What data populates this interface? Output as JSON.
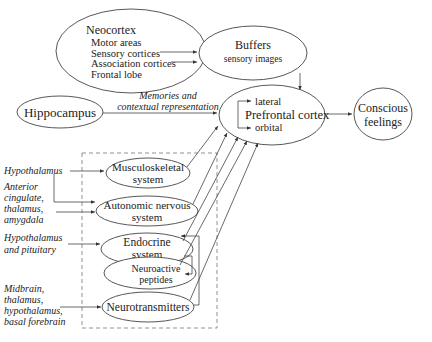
{
  "nodes": {
    "neocortex": {
      "title": "Neocortex",
      "items": [
        "Motor areas",
        "Sensory cortices",
        "Association cortices",
        "Frontal lobe"
      ]
    },
    "buffers": {
      "title": "Buffers",
      "subtitle": "sensory images"
    },
    "hippocampus": {
      "title": "Hippocampus"
    },
    "prefrontal": {
      "title": "Prefrontal cortex",
      "top": "lateral",
      "bottom": "orbital"
    },
    "conscious": {
      "line1": "Conscious",
      "line2": "feelings"
    },
    "musculoskeletal": {
      "line1": "Musculoskeletal",
      "line2": "system"
    },
    "autonomic": {
      "line1": "Autonomic nervous",
      "line2": "system"
    },
    "endocrine": {
      "line1": "Endocrine",
      "line2": "system"
    },
    "peptides": {
      "line1": "Neuroactive",
      "line2": "peptides"
    },
    "neurotransmitters": {
      "title": "Neurotransmitters"
    }
  },
  "edge_labels": {
    "memories_1": "Memories and",
    "memories_2": "contextual representation"
  },
  "inputs": {
    "hypothalamus": "Hypothalamus",
    "anterior": [
      "Anterior",
      "cingulate,",
      "thalamus,",
      "amygdala"
    ],
    "hypo_pit": [
      "Hypothalamus",
      "and pituitary"
    ],
    "midbrain": [
      "Midbrain,",
      "thalamus,",
      "hypothalamus,",
      "basal forebrain"
    ]
  }
}
